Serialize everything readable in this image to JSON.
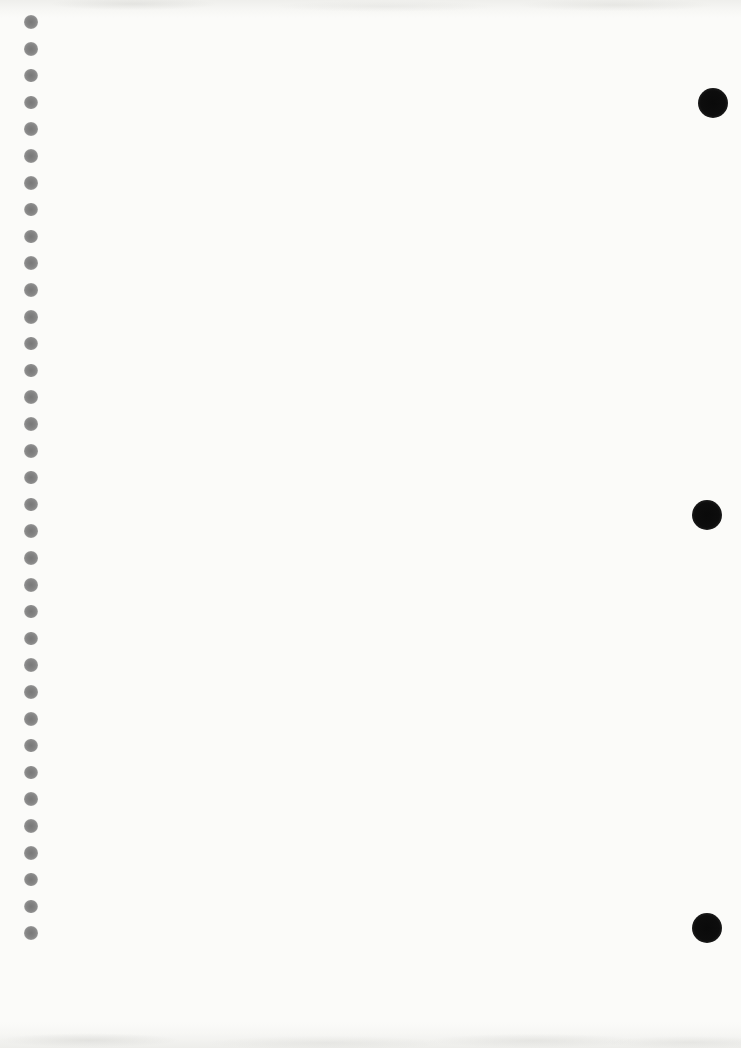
{
  "page": {
    "width": 741,
    "height": 1048,
    "background_color": "#fbfbf9",
    "edge_noise_color": "#d2d2cd",
    "content_text": ""
  },
  "binding_holes": {
    "icon": "binding-hole-icon",
    "count": 35,
    "center_x": 31,
    "first_center_y": 22,
    "spacing_y": 26.8,
    "diameter": 13.5,
    "color": "#848484"
  },
  "punch_holes": {
    "icon": "punch-hole-icon",
    "count": 3,
    "diameter": 30,
    "color": "#0d0d0d",
    "positions": [
      {
        "cx": 713,
        "cy": 103
      },
      {
        "cx": 707,
        "cy": 515
      },
      {
        "cx": 707,
        "cy": 928
      }
    ]
  }
}
